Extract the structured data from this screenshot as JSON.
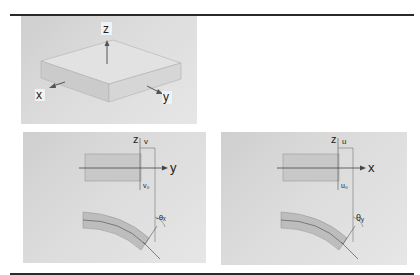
{
  "figure": {
    "panels": [
      {
        "id": "plate",
        "description": "Isometric plate with coordinate axes",
        "axes_labels": {
          "z": "z",
          "x": "x",
          "y": "y"
        }
      },
      {
        "id": "bending-yz",
        "description": "Beam cross-section bending in y-z plane",
        "labels": {
          "vertical_axis": "z",
          "horizontal_axis": "y",
          "displacement": "v",
          "displacement_0": "v₀",
          "rotation": "-θₓ"
        }
      },
      {
        "id": "bending-xz",
        "description": "Beam cross-section bending in x-z plane",
        "labels": {
          "vertical_axis": "z",
          "horizontal_axis": "x",
          "displacement": "u",
          "displacement_0": "u₀",
          "rotation": "θᵧ"
        }
      }
    ]
  },
  "colors": {
    "rule": "#2a2a2a",
    "panel_bg": "#d8d8d8",
    "beam_fill": "#bdbdbd",
    "line": "#444444"
  }
}
